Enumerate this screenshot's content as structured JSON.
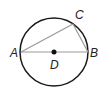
{
  "diagram": {
    "type": "circle-geometry",
    "circle": {
      "center_label": "D"
    },
    "points": [
      {
        "label": "A",
        "role": "endpoint of diameter"
      },
      {
        "label": "B",
        "role": "endpoint of diameter"
      },
      {
        "label": "C",
        "role": "point on circle"
      },
      {
        "label": "D",
        "role": "center"
      }
    ],
    "segments": [
      "AB",
      "AC",
      "CB"
    ],
    "colors": {
      "circle": "#1a1a1a",
      "chords": "#9a9a9a",
      "center_dot": "#111111"
    }
  },
  "labels": {
    "a": "A",
    "b": "B",
    "c": "C",
    "d": "D"
  }
}
